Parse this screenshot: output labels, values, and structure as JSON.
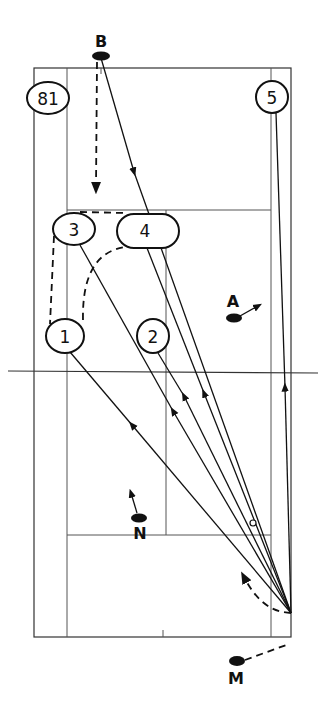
{
  "diagram": {
    "type": "badminton-court-tactics",
    "colors": {
      "ink": "#111111",
      "court_lines": "#555555",
      "background": "#ffffff"
    },
    "players": [
      {
        "id": "B",
        "label": "B",
        "x": 101,
        "y": 55
      },
      {
        "id": "A",
        "label": "A",
        "x": 233,
        "y": 318
      },
      {
        "id": "N",
        "label": "N",
        "x": 138,
        "y": 517
      },
      {
        "id": "M",
        "label": "M",
        "x": 236,
        "y": 660
      }
    ],
    "positions": [
      {
        "id": "81",
        "label": "81",
        "x": 48,
        "y": 98,
        "rx": 21,
        "ry": 16
      },
      {
        "id": "5",
        "label": "5",
        "x": 272,
        "y": 97,
        "rx": 16,
        "ry": 16
      },
      {
        "id": "3",
        "label": "3",
        "x": 74,
        "y": 229,
        "rx": 21,
        "ry": 16
      },
      {
        "id": "4",
        "label": "4",
        "x": 147,
        "y": 231,
        "rx": 30,
        "ry": 17
      },
      {
        "id": "1",
        "label": "1",
        "x": 65,
        "y": 336,
        "rx": 19,
        "ry": 17
      },
      {
        "id": "2",
        "label": "2",
        "x": 153,
        "y": 336,
        "rx": 16,
        "ry": 17
      }
    ],
    "labels": {
      "B": "B",
      "A": "A",
      "N": "N",
      "M": "M",
      "pos_81": "81",
      "pos_5": "5",
      "pos_3": "3",
      "pos_4": "4",
      "pos_1": "1",
      "pos_2": "2"
    }
  }
}
